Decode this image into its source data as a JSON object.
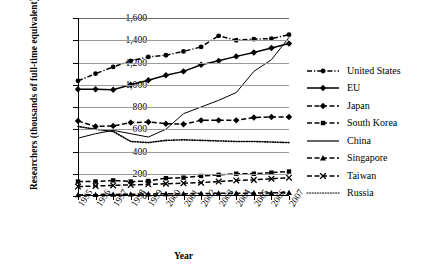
{
  "chart_data": {
    "type": "line",
    "title": "",
    "xlabel": "Year",
    "ylabel": "Researchers (thousands of full-time equivalent)",
    "categories": [
      "1995",
      "1996",
      "1997",
      "1998",
      "1999",
      "2000",
      "2001",
      "2002",
      "2003",
      "2004",
      "2005",
      "2006",
      "2007"
    ],
    "x": [
      1995,
      1996,
      1997,
      1998,
      1999,
      2000,
      2001,
      2002,
      2003,
      2004,
      2005,
      2006,
      2007
    ],
    "ylim": [
      0,
      1600
    ],
    "yticks": [
      "0",
      "200",
      "400",
      "600",
      "800",
      "1,000",
      "1,200",
      "1,400",
      "1,600"
    ],
    "ytick_values": [
      0,
      200,
      400,
      600,
      800,
      1000,
      1200,
      1400,
      1600
    ],
    "grid": true,
    "legend_position": "right",
    "series": [
      {
        "name": "United States",
        "marker": "circle",
        "line_style": "dash-dot",
        "values": [
          1035,
          1100,
          1160,
          1215,
          1250,
          1265,
          1300,
          1340,
          1440,
          1400,
          1410,
          1415,
          1450
        ]
      },
      {
        "name": "EU",
        "marker": "diamond",
        "line_style": "solid",
        "values": [
          960,
          960,
          955,
          1000,
          1040,
          1085,
          1120,
          1180,
          1215,
          1255,
          1290,
          1330,
          1370
        ]
      },
      {
        "name": "Japan",
        "marker": "diamond",
        "line_style": "dash",
        "values": [
          675,
          625,
          630,
          660,
          665,
          650,
          645,
          680,
          680,
          680,
          705,
          710,
          710
        ]
      },
      {
        "name": "South Korea",
        "marker": "square",
        "line_style": "dash",
        "values": [
          130,
          130,
          140,
          130,
          135,
          160,
          165,
          180,
          190,
          200,
          200,
          210,
          220
        ]
      },
      {
        "name": "China",
        "marker": "none",
        "line_style": "solid",
        "values": [
          520,
          560,
          590,
          560,
          530,
          600,
          740,
          800,
          860,
          930,
          1120,
          1225,
          1425
        ]
      },
      {
        "name": "Singapore",
        "marker": "triangle",
        "line_style": "dash",
        "values": [
          10,
          12,
          14,
          16,
          18,
          20,
          21,
          22,
          24,
          25,
          26,
          28,
          30
        ]
      },
      {
        "name": "Taiwan",
        "marker": "x",
        "line_style": "dash",
        "values": [
          85,
          90,
          95,
          100,
          105,
          110,
          115,
          120,
          130,
          140,
          145,
          155,
          165
        ]
      },
      {
        "name": "Russia",
        "marker": "none",
        "line_style": "dotted",
        "values": [
          625,
          600,
          580,
          490,
          480,
          500,
          505,
          500,
          495,
          490,
          490,
          485,
          480
        ]
      }
    ]
  }
}
